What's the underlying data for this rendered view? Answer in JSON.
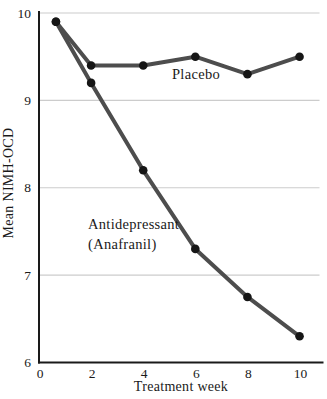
{
  "figure": {
    "background": "#ffffff"
  },
  "chart_data": {
    "type": "line",
    "x": [
      0.65,
      2,
      4,
      6,
      8,
      10
    ],
    "series": [
      {
        "name": "Placebo",
        "values": [
          9.9,
          9.4,
          9.4,
          9.5,
          9.3,
          9.5
        ]
      },
      {
        "name": "Antidepressant (Anafranil)",
        "values": [
          9.9,
          9.2,
          8.2,
          7.3,
          6.75,
          6.3
        ]
      }
    ],
    "title": "",
    "xlabel": "Treatment week",
    "ylabel": "Mean NIMH-OCD",
    "xticks": [
      0,
      2,
      4,
      6,
      8,
      10
    ],
    "yticks": [
      6,
      7,
      8,
      9,
      10
    ],
    "xlim": [
      0,
      10.9
    ],
    "ylim": [
      6,
      10
    ],
    "grid_lines_at": [
      7,
      8,
      9,
      10
    ],
    "legend_position": "inline-annotations",
    "annotations": {
      "placebo_label": "Placebo",
      "anafranil_label_line1": "Antidepressant",
      "anafranil_label_line2": "(Anafranil)"
    },
    "colors": {
      "line": "#4d4d4d",
      "marker": "#161616",
      "grid": "#cccccc",
      "axis": "#1a1a1a",
      "text": "#1a1a1a"
    }
  }
}
